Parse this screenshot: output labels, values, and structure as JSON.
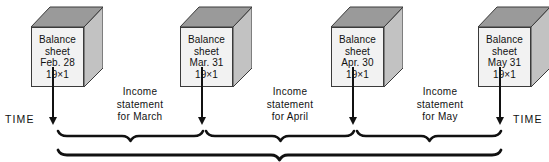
{
  "diagram": {
    "colors": {
      "cube_front": "#f2f2f2",
      "cube_top": "#9a9a9a",
      "cube_side": "#c2c2c2",
      "outline": "#3a3a3a",
      "ink": "#111111",
      "background": "#ffffff"
    },
    "boxes": [
      {
        "id": "balance-sheet-feb",
        "line1": "Balance",
        "line2": "sheet",
        "line3": "Feb. 28",
        "line4": "19×1",
        "x": 31,
        "y": 6
      },
      {
        "id": "balance-sheet-mar",
        "line1": "Balance",
        "line2": "sheet",
        "line3": "Mar. 31",
        "line4": "19×1",
        "x": 180,
        "y": 6
      },
      {
        "id": "balance-sheet-apr",
        "line1": "Balance",
        "line2": "sheet",
        "line3": "Apr. 30",
        "line4": "19×1",
        "x": 331,
        "y": 6
      },
      {
        "id": "balance-sheet-may",
        "line1": "Balance",
        "line2": "sheet",
        "line3": "May 31",
        "line4": "19×1",
        "x": 478,
        "y": 6
      }
    ],
    "income_statements": [
      {
        "id": "income-statement-march",
        "line1": "Income",
        "line2": "statement",
        "line3": "for March",
        "x": 92,
        "y": 86
      },
      {
        "id": "income-statement-april",
        "line1": "Income",
        "line2": "statement",
        "line3": "for April",
        "x": 242,
        "y": 86
      },
      {
        "id": "income-statement-may",
        "line1": "Income",
        "line2": "statement",
        "line3": "for May",
        "x": 392,
        "y": 86
      }
    ],
    "time_labels": [
      {
        "id": "time-label-left",
        "text": "TIME",
        "x": 5,
        "y": 113
      },
      {
        "id": "time-label-right",
        "text": "TIME",
        "x": 513,
        "y": 113
      }
    ],
    "arrows": [
      {
        "id": "arrow-feb",
        "x": 53,
        "y": 67,
        "length": 58
      },
      {
        "id": "arrow-mar",
        "x": 202,
        "y": 67,
        "length": 58
      },
      {
        "id": "arrow-apr",
        "x": 353,
        "y": 67,
        "length": 58
      },
      {
        "id": "arrow-may",
        "x": 500,
        "y": 67,
        "length": 58
      }
    ],
    "brackets": [
      {
        "id": "bracket-march",
        "x1": 58,
        "x2": 203,
        "y": 131
      },
      {
        "id": "bracket-april",
        "x1": 206,
        "x2": 354,
        "y": 131
      },
      {
        "id": "bracket-may",
        "x1": 357,
        "x2": 501,
        "y": 131
      },
      {
        "id": "bracket-total",
        "x1": 58,
        "x2": 501,
        "y": 150
      }
    ]
  }
}
